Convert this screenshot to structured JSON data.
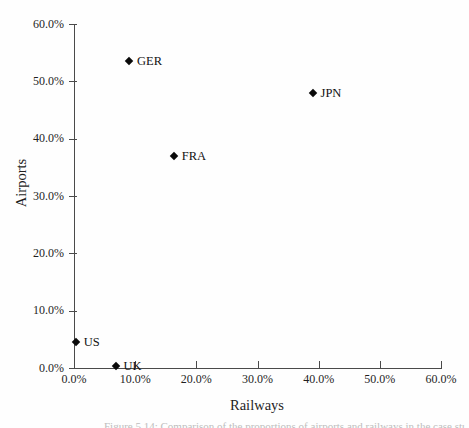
{
  "chart_data": {
    "type": "scatter",
    "title": "",
    "xlabel": "Railways",
    "ylabel": "Airports",
    "xlim": [
      0,
      60
    ],
    "ylim": [
      0,
      60
    ],
    "grid": "off",
    "legend": "none",
    "marker": "filled-diamond",
    "x_ticks": [
      {
        "label": "0.0%",
        "value": 0
      },
      {
        "label": "10.0%",
        "value": 10
      },
      {
        "label": "20.0%",
        "value": 20
      },
      {
        "label": "30.0%",
        "value": 30
      },
      {
        "label": "40.0%",
        "value": 40
      },
      {
        "label": "50.0%",
        "value": 50
      },
      {
        "label": "60.0%",
        "value": 60
      }
    ],
    "y_ticks": [
      {
        "label": "0.0%",
        "value": 0
      },
      {
        "label": "10.0%",
        "value": 10
      },
      {
        "label": "20.0%",
        "value": 20
      },
      {
        "label": "30.0%",
        "value": 30
      },
      {
        "label": "40.0%",
        "value": 40
      },
      {
        "label": "50.0%",
        "value": 50
      },
      {
        "label": "60.0%",
        "value": 60
      }
    ],
    "points": [
      {
        "label": "US",
        "x": 0.3,
        "y": 4.5
      },
      {
        "label": "UK",
        "x": 6.8,
        "y": 0.3
      },
      {
        "label": "GER",
        "x": 9.0,
        "y": 53.5
      },
      {
        "label": "FRA",
        "x": 16.3,
        "y": 37.0
      },
      {
        "label": "JPN",
        "x": 39.0,
        "y": 48.0
      }
    ]
  },
  "caption": {
    "text": "Figure 5.14: Comparison of the proportions of airports and railways in the case study countries"
  },
  "colors": {
    "axis": "#4a4a4a",
    "text": "#1f1f1f",
    "marker": "#0a0a0a",
    "caption": "#bdbdbd",
    "background": "#fefefe"
  }
}
